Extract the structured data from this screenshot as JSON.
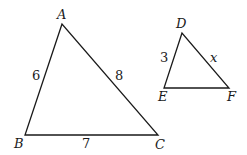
{
  "diagram": {
    "type": "similar-triangles",
    "triangles": [
      {
        "name": "ABC",
        "vertices": {
          "A": {
            "label": "A",
            "x": 62,
            "y": 24
          },
          "B": {
            "label": "B",
            "x": 25,
            "y": 135
          },
          "C": {
            "label": "C",
            "x": 158,
            "y": 135
          }
        },
        "sides": {
          "AB": "6",
          "AC": "8",
          "BC": "7"
        }
      },
      {
        "name": "DEF",
        "vertices": {
          "D": {
            "label": "D",
            "x": 182,
            "y": 33
          },
          "E": {
            "label": "E",
            "x": 164,
            "y": 88
          },
          "F": {
            "label": "F",
            "x": 229,
            "y": 88
          }
        },
        "sides": {
          "DE": "3",
          "DF": "x"
        }
      }
    ],
    "colors": {
      "stroke": "#1a1a1a",
      "background": "#ffffff"
    }
  }
}
